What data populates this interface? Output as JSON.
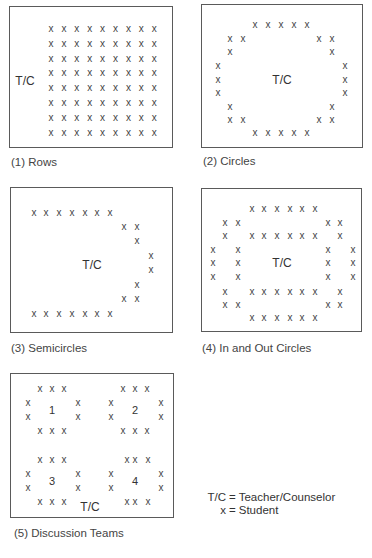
{
  "legend": {
    "items": [
      {
        "key": "T/C",
        "sep": "=",
        "value": "Teacher/Counselor"
      },
      {
        "key": "x",
        "sep": "=",
        "value": "Student"
      }
    ]
  },
  "symbols": {
    "student": "x",
    "teacher": "T/C"
  },
  "panels": [
    {
      "id": 1,
      "caption": "(1) Rows",
      "layout": "9 columns × 8 rows of students facing teacher at left"
    },
    {
      "id": 2,
      "caption": "(2) Circles",
      "layout": "single ring of students with teacher in center"
    },
    {
      "id": 3,
      "caption": "(3) Semicircles",
      "layout": "C-shaped arc of students opening to the left, teacher in center"
    },
    {
      "id": 4,
      "caption": "(4) In and Out Circles",
      "layout": "inner ring and outer ring of students, teacher in center"
    },
    {
      "id": 5,
      "caption": "(5) Discussion Teams",
      "layout": "four small circles of students numbered 1-4, teacher at bottom center",
      "team_labels": [
        "1",
        "2",
        "3",
        "4"
      ]
    }
  ],
  "footer_cutoff_text": ""
}
